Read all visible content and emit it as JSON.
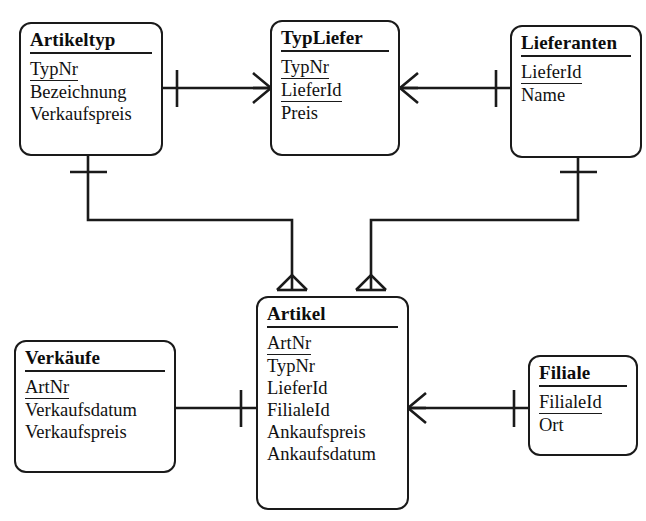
{
  "diagram": {
    "notation": "crow's foot",
    "line_color": "#1a1a1a",
    "background": "#ffffff"
  },
  "entities": [
    {
      "id": "artikeltyp",
      "name": "Artikeltyp",
      "attributes": [
        {
          "label": "TypNr",
          "key": true
        },
        {
          "label": "Bezeichnung",
          "key": false
        },
        {
          "label": "Verkaufspreis",
          "key": false
        }
      ]
    },
    {
      "id": "typliefer",
      "name": "TypLiefer",
      "attributes": [
        {
          "label": "TypNr",
          "key": true
        },
        {
          "label": "LieferId",
          "key": true
        },
        {
          "label": "Preis",
          "key": false
        }
      ]
    },
    {
      "id": "lieferanten",
      "name": "Lieferanten",
      "attributes": [
        {
          "label": "LieferId",
          "key": true
        },
        {
          "label": "Name",
          "key": false
        }
      ]
    },
    {
      "id": "artikel",
      "name": "Artikel",
      "attributes": [
        {
          "label": "ArtNr",
          "key": true
        },
        {
          "label": "TypNr",
          "key": false
        },
        {
          "label": "LieferId",
          "key": false
        },
        {
          "label": "FilialeId",
          "key": false
        },
        {
          "label": "Ankaufspreis",
          "key": false
        },
        {
          "label": "Ankaufsdatum",
          "key": false
        }
      ]
    },
    {
      "id": "verkaeufe",
      "name": "Verkäufe",
      "attributes": [
        {
          "label": "ArtNr",
          "key": true
        },
        {
          "label": "Verkaufsdatum",
          "key": false
        },
        {
          "label": "Verkaufspreis",
          "key": false
        }
      ]
    },
    {
      "id": "filiale",
      "name": "Filiale",
      "attributes": [
        {
          "label": "FilialeId",
          "key": true
        },
        {
          "label": "Ort",
          "key": false
        }
      ]
    }
  ],
  "relationships": [
    {
      "id": "rel-artikeltyp-typliefer",
      "from": "artikeltyp",
      "to": "typliefer",
      "from_cardinality": "one",
      "to_cardinality": "many"
    },
    {
      "id": "rel-typliefer-lieferanten",
      "from": "typliefer",
      "to": "lieferanten",
      "from_cardinality": "many",
      "to_cardinality": "one"
    },
    {
      "id": "rel-artikeltyp-artikel",
      "from": "artikeltyp",
      "to": "artikel",
      "from_cardinality": "one",
      "to_cardinality": "many"
    },
    {
      "id": "rel-lieferanten-artikel",
      "from": "lieferanten",
      "to": "artikel",
      "from_cardinality": "one",
      "to_cardinality": "many"
    },
    {
      "id": "rel-verkaeufe-artikel",
      "from": "verkaeufe",
      "to": "artikel",
      "from_cardinality": "many",
      "to_cardinality": "one"
    },
    {
      "id": "rel-artikel-filiale",
      "from": "artikel",
      "to": "filiale",
      "from_cardinality": "many",
      "to_cardinality": "one"
    }
  ]
}
